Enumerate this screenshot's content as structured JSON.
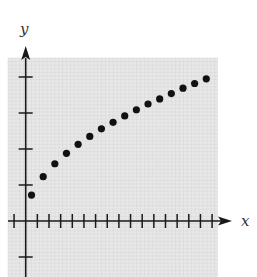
{
  "chart_data": {
    "type": "scatter",
    "title": "",
    "xlabel": "x",
    "ylabel": "y",
    "xlim": [
      -1,
      16
    ],
    "ylim": [
      -1,
      4
    ],
    "grid": true,
    "legend": null,
    "x_ticks": [
      -1,
      1,
      2,
      3,
      4,
      5,
      6,
      7,
      8,
      9,
      10,
      11,
      12,
      13,
      14,
      15,
      16
    ],
    "y_ticks": [
      -1,
      1,
      2,
      3,
      4
    ],
    "x": [
      0.5,
      1.5,
      2.5,
      3.5,
      4.5,
      5.5,
      6.5,
      7.5,
      8.5,
      9.5,
      10.5,
      11.5,
      12.5,
      13.5,
      14.5,
      15.5
    ],
    "y": [
      0.72,
      1.23,
      1.59,
      1.88,
      2.13,
      2.35,
      2.56,
      2.74,
      2.92,
      3.09,
      3.25,
      3.39,
      3.54,
      3.69,
      3.82,
      3.95
    ]
  },
  "colors": {
    "background": "#e8e8e8",
    "grid": "#d6d6d6",
    "axis": "#1a1a1a",
    "points": "#111111"
  }
}
